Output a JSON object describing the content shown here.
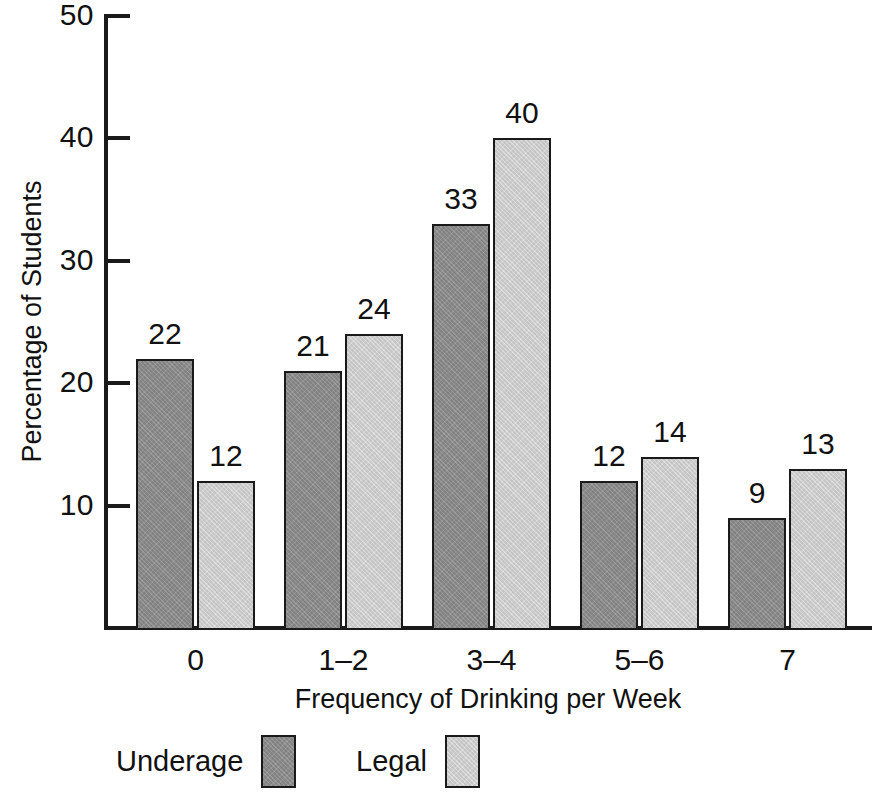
{
  "chart_data": {
    "type": "bar",
    "title": "",
    "xlabel": "Frequency of Drinking per Week",
    "ylabel": "Percentage of Students",
    "categories": [
      "0",
      "1–2",
      "3–4",
      "5–6",
      "7"
    ],
    "series": [
      {
        "name": "Underage",
        "values": [
          22,
          21,
          33,
          12,
          9
        ],
        "color": "#8d8d8d"
      },
      {
        "name": "Legal",
        "values": [
          12,
          24,
          40,
          14,
          13
        ],
        "color": "#d2d2d2"
      }
    ],
    "ylim": [
      0,
      50
    ],
    "yticks": [
      10,
      20,
      30,
      40,
      50
    ],
    "ytick_labels": [
      "10",
      "20",
      "30",
      "40",
      "50"
    ],
    "grid": false,
    "legend_position": "bottom",
    "data_labels": true
  },
  "axes": {
    "y_title": "Percentage of Students",
    "x_title": "Frequency of Drinking per Week",
    "y_ticks": [
      {
        "value": 50,
        "label": "50"
      },
      {
        "value": 40,
        "label": "40"
      },
      {
        "value": 30,
        "label": "30"
      },
      {
        "value": 20,
        "label": "20"
      },
      {
        "value": 10,
        "label": "10"
      }
    ],
    "x_categories": [
      {
        "label": "0"
      },
      {
        "label": "1–2"
      },
      {
        "label": "3–4"
      },
      {
        "label": "5–6"
      },
      {
        "label": "7"
      }
    ]
  },
  "bars": [
    {
      "group": "0",
      "series": "Underage",
      "value": 22,
      "label": "22"
    },
    {
      "group": "0",
      "series": "Legal",
      "value": 12,
      "label": "12"
    },
    {
      "group": "1–2",
      "series": "Underage",
      "value": 21,
      "label": "21"
    },
    {
      "group": "1–2",
      "series": "Legal",
      "value": 24,
      "label": "24"
    },
    {
      "group": "3–4",
      "series": "Underage",
      "value": 33,
      "label": "33"
    },
    {
      "group": "3–4",
      "series": "Legal",
      "value": 40,
      "label": "40"
    },
    {
      "group": "5–6",
      "series": "Underage",
      "value": 12,
      "label": "12"
    },
    {
      "group": "5–6",
      "series": "Legal",
      "value": 14,
      "label": "14"
    },
    {
      "group": "7",
      "series": "Underage",
      "value": 9,
      "label": "9"
    },
    {
      "group": "7",
      "series": "Legal",
      "value": 13,
      "label": "13"
    }
  ],
  "legend": {
    "entries": [
      {
        "label": "Underage",
        "color": "#8d8d8d"
      },
      {
        "label": "Legal",
        "color": "#d2d2d2"
      }
    ]
  },
  "colors": {
    "underage": "#8d8d8d",
    "legal": "#d2d2d2",
    "axis": "#1a1a1a",
    "background": "#ffffff",
    "text": "#111111"
  }
}
